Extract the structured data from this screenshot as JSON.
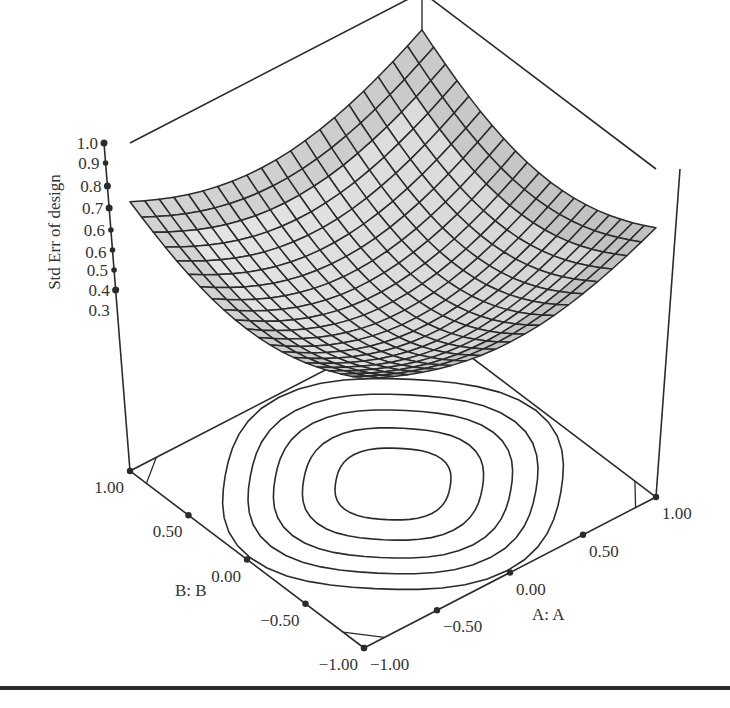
{
  "chart_data": {
    "type": "surface3d",
    "title": "",
    "zlabel": "Std Err of design",
    "xlabel": "A: A",
    "ylabel": "B: B",
    "z_ticks": [
      "1.0",
      "0.9",
      "0.8",
      "0.7",
      "0.6",
      "0.6",
      "0.5",
      "0.4",
      "0.3"
    ],
    "x_ticks": [
      "-1.00",
      "-0.50",
      "0.00",
      "0.50",
      "1.00"
    ],
    "y_ticks": [
      "1.00",
      "0.50",
      "0.00",
      "-0.50",
      "-1.00"
    ],
    "zlim": [
      0.3,
      1.0
    ],
    "xlim": [
      -1.0,
      1.0
    ],
    "ylim": [
      -1.0,
      1.0
    ],
    "grid_resolution": 21,
    "surface_description": "Bowl-shaped standard error surface: minimum ~0.30 at center (A=0,B=0), rising to ~0.78 at side corners and ~1.0 at back corner",
    "surface_samples": [
      {
        "A": 0.0,
        "B": 0.0,
        "z": 0.3
      },
      {
        "A": -1.0,
        "B": 1.0,
        "z": 0.78
      },
      {
        "A": 1.0,
        "B": -1.0,
        "z": 0.78
      },
      {
        "A": 1.0,
        "B": 1.0,
        "z": 1.0
      },
      {
        "A": -1.0,
        "B": -1.0,
        "z": 0.3
      }
    ],
    "contour_levels": 5,
    "contour_center": {
      "A": 0.0,
      "B": 0.0
    },
    "legend": null,
    "grid": false
  },
  "figure": {
    "surface_fill": "#d8d8d8",
    "surface_fill_light": "#f0f0f0",
    "surface_fill_dark": "#a8a8a8",
    "mesh_stroke": "#2b2b2b",
    "axis_stroke": "#2b2b2b",
    "rule_color": "#2a2a2a"
  }
}
